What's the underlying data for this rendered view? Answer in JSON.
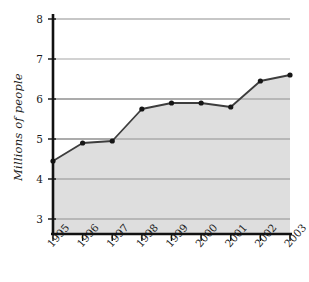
{
  "chart_data": {
    "type": "area",
    "title": "",
    "subtitle": "",
    "xlabel": "",
    "ylabel": "Millions of people",
    "categories": [
      "1995",
      "1996",
      "1997",
      "1998",
      "1999",
      "2000",
      "2001",
      "2002",
      "2003"
    ],
    "values": [
      4.45,
      4.9,
      4.95,
      5.75,
      5.9,
      5.9,
      5.8,
      6.45,
      6.6
    ],
    "series": [
      {
        "name": "Millions of people",
        "values": [
          4.45,
          4.9,
          4.95,
          5.75,
          5.9,
          5.9,
          5.8,
          6.45,
          6.6
        ]
      }
    ],
    "ylim": [
      2.6,
      8.0
    ],
    "yticks": [
      3,
      4,
      5,
      6,
      7,
      8
    ],
    "ytick_labels": [
      "3",
      "4",
      "5",
      "6",
      "7",
      "8"
    ],
    "xtick_labels": [
      "1995",
      "1996",
      "1997",
      "1998",
      "1999",
      "2000",
      "2001",
      "2002",
      "2003"
    ],
    "grid": true,
    "grid_axis": "y",
    "legend": false,
    "legend_position": "none",
    "xtick_label_rotation": -48,
    "marker": "circle",
    "colors": {
      "area_fill": "#dedede",
      "line": "#3d3d3d",
      "marker": "#161616",
      "gridline": "#8f8f8f",
      "axis": "#111111",
      "text": "#1a1a1a",
      "background": "#ffffff"
    }
  }
}
